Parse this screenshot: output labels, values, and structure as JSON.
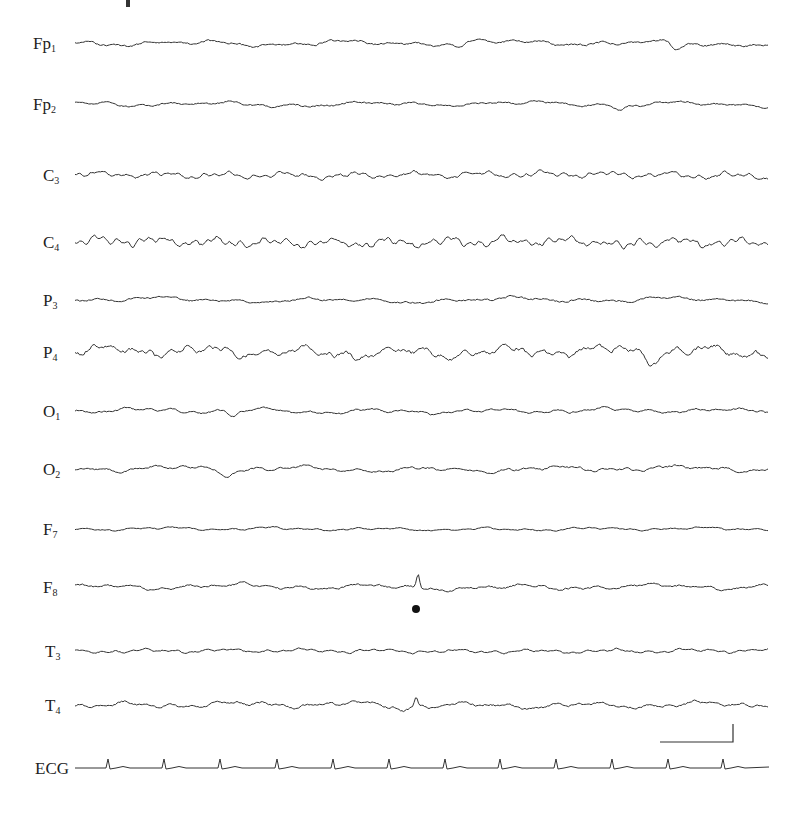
{
  "chart_data": {
    "type": "line",
    "title": "",
    "x_range": [
      75,
      769
    ],
    "channels": [
      {
        "id": "Fp1",
        "base": "Fp",
        "sub": "1",
        "y": 43,
        "amp": 3.2,
        "freq": 0.9,
        "seed": 1,
        "dips": [
          [
            458,
            5
          ],
          [
            676,
            7
          ]
        ]
      },
      {
        "id": "Fp2",
        "base": "Fp",
        "sub": "2",
        "y": 104,
        "amp": 2.8,
        "freq": 0.9,
        "seed": 2,
        "dips": [
          [
            620,
            6
          ]
        ]
      },
      {
        "id": "C3",
        "base": "C",
        "sub": "3",
        "y": 175,
        "amp": 3.5,
        "freq": 2.2,
        "seed": 3,
        "dips": []
      },
      {
        "id": "C4",
        "base": "C",
        "sub": "4",
        "y": 242,
        "amp": 5.0,
        "freq": 2.4,
        "seed": 4,
        "dips": [
          [
            623,
            10
          ]
        ]
      },
      {
        "id": "P3",
        "base": "P",
        "sub": "3",
        "y": 300,
        "amp": 3.0,
        "freq": 0.8,
        "seed": 5,
        "dips": []
      },
      {
        "id": "P4",
        "base": "P",
        "sub": "4",
        "y": 352,
        "amp": 6.5,
        "freq": 1.4,
        "seed": 6,
        "dips": [
          [
            654,
            9
          ]
        ]
      },
      {
        "id": "O1",
        "base": "O",
        "sub": "1",
        "y": 411,
        "amp": 2.8,
        "freq": 1.2,
        "seed": 7,
        "dips": [
          [
            234,
            6
          ]
        ]
      },
      {
        "id": "O2",
        "base": "O",
        "sub": "2",
        "y": 469,
        "amp": 3.2,
        "freq": 1.1,
        "seed": 8,
        "dips": [
          [
            228,
            6
          ]
        ]
      },
      {
        "id": "F7",
        "base": "F",
        "sub": "7",
        "y": 529,
        "amp": 1.8,
        "freq": 1.3,
        "seed": 9,
        "dips": []
      },
      {
        "id": "F8",
        "base": "F",
        "sub": "8",
        "y": 587,
        "amp": 3.2,
        "freq": 1.0,
        "seed": 10,
        "dips": [],
        "spike": [
          418,
          -14
        ]
      },
      {
        "id": "T3",
        "base": "T",
        "sub": "3",
        "y": 651,
        "amp": 2.2,
        "freq": 1.8,
        "seed": 11,
        "dips": []
      },
      {
        "id": "T4",
        "base": "T",
        "sub": "4",
        "y": 705,
        "amp": 3.4,
        "freq": 1.2,
        "seed": 12,
        "dips": [
          [
            402,
            5
          ]
        ],
        "spike": [
          416,
          -8
        ]
      }
    ],
    "ecg": {
      "id": "ECG",
      "label": "ECG",
      "y": 768,
      "beats": [
        108,
        164,
        220,
        277,
        333,
        389,
        445,
        500,
        556,
        612,
        668,
        723
      ]
    },
    "annotations": {
      "marker_dot": {
        "x": 416,
        "y": 609,
        "r": 4
      },
      "scale_bar": {
        "x1": 660,
        "x2": 733,
        "y": 742,
        "y_top": 724
      }
    }
  },
  "labels": {
    "Fp1": "Fp",
    "Fp1_sub": "1",
    "Fp2": "Fp",
    "Fp2_sub": "2",
    "C3": "C",
    "C3_sub": "3",
    "C4": "C",
    "C4_sub": "4",
    "P3": "P",
    "P3_sub": "3",
    "P4": "P",
    "P4_sub": "4",
    "O1": "O",
    "O1_sub": "1",
    "O2": "O",
    "O2_sub": "2",
    "F7": "F",
    "F7_sub": "7",
    "F8": "F",
    "F8_sub": "8",
    "T3": "T",
    "T3_sub": "3",
    "T4": "T",
    "T4_sub": "4",
    "ECG": "ECG"
  }
}
